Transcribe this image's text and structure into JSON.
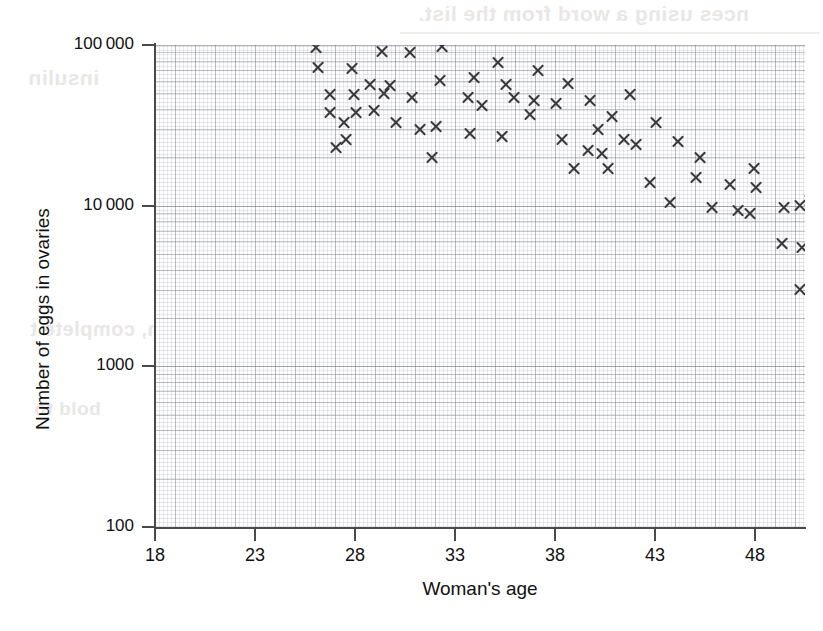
{
  "figure": {
    "kind": "scatter-graph",
    "marker": "cross-x-marker",
    "background_bleed_text": {
      "top": "nces using a word from the list.",
      "insulin": "insulin",
      "middle": "can, complete t",
      "bold": "bold to",
      "right": "the"
    }
  },
  "chart_data": {
    "type": "scatter",
    "title": "",
    "xlabel": "Woman's age",
    "ylabel": "Number of eggs in ovaries",
    "xlim": [
      18,
      50.5
    ],
    "ylim": [
      100,
      120000
    ],
    "yscale": "log",
    "xticks": [
      18,
      23,
      28,
      33,
      38,
      43,
      48
    ],
    "xtick_labels": [
      "18",
      "23",
      "28",
      "33",
      "38",
      "43",
      "48"
    ],
    "yticks": [
      100,
      1000,
      10000,
      100000
    ],
    "ytick_labels": [
      "100",
      "1000",
      "10 000",
      "100 000"
    ],
    "grid": "minor and major grid lines on both axes",
    "legend": "none",
    "marker_style": "x",
    "marker_color": "#3a3a3c",
    "n_points": 74,
    "points": [
      {
        "age": 18.3,
        "eggs": 97000
      },
      {
        "age": 18.4,
        "eggs": 72000
      },
      {
        "age": 19.9,
        "eggs": 108000
      },
      {
        "age": 20.1,
        "eggs": 71000
      },
      {
        "age": 19.0,
        "eggs": 49000
      },
      {
        "age": 20.2,
        "eggs": 49000
      },
      {
        "age": 19.0,
        "eggs": 38000
      },
      {
        "age": 20.3,
        "eggs": 38000
      },
      {
        "age": 19.7,
        "eggs": 33000
      },
      {
        "age": 19.8,
        "eggs": 26000
      },
      {
        "age": 19.3,
        "eggs": 23000
      },
      {
        "age": 21.6,
        "eggs": 91000
      },
      {
        "age": 21.7,
        "eggs": 50000
      },
      {
        "age": 21.2,
        "eggs": 39000
      },
      {
        "age": 22.3,
        "eggs": 33000
      },
      {
        "age": 23.0,
        "eggs": 90000
      },
      {
        "age": 23.1,
        "eggs": 47000
      },
      {
        "age": 23.5,
        "eggs": 30000
      },
      {
        "age": 24.6,
        "eggs": 98000
      },
      {
        "age": 24.5,
        "eggs": 60000
      },
      {
        "age": 24.3,
        "eggs": 31000
      },
      {
        "age": 24.1,
        "eggs": 20000
      },
      {
        "age": 26.2,
        "eggs": 63000
      },
      {
        "age": 26.6,
        "eggs": 42000
      },
      {
        "age": 26.0,
        "eggs": 28000
      },
      {
        "age": 27.4,
        "eggs": 78000
      },
      {
        "age": 27.8,
        "eggs": 57000
      },
      {
        "age": 28.2,
        "eggs": 47000
      },
      {
        "age": 27.6,
        "eggs": 27000
      },
      {
        "age": 29.4,
        "eggs": 69000
      },
      {
        "age": 29.2,
        "eggs": 45000
      },
      {
        "age": 29.0,
        "eggs": 37000
      },
      {
        "age": 30.9,
        "eggs": 58000
      },
      {
        "age": 30.3,
        "eggs": 43000
      },
      {
        "age": 30.6,
        "eggs": 26000
      },
      {
        "age": 31.2,
        "eggs": 17000
      },
      {
        "age": 32.0,
        "eggs": 45000
      },
      {
        "age": 32.4,
        "eggs": 30000
      },
      {
        "age": 31.9,
        "eggs": 22000
      },
      {
        "age": 33.1,
        "eggs": 36000
      },
      {
        "age": 32.6,
        "eggs": 21000
      },
      {
        "age": 32.9,
        "eggs": 17000
      },
      {
        "age": 34.0,
        "eggs": 49000
      },
      {
        "age": 33.7,
        "eggs": 26000
      },
      {
        "age": 34.3,
        "eggs": 24000
      },
      {
        "age": 35.3,
        "eggs": 33000
      },
      {
        "age": 35.0,
        "eggs": 14000
      },
      {
        "age": 36.4,
        "eggs": 25000
      },
      {
        "age": 36.0,
        "eggs": 10500
      },
      {
        "age": 37.5,
        "eggs": 20000
      },
      {
        "age": 37.3,
        "eggs": 15000
      },
      {
        "age": 38.1,
        "eggs": 9700
      },
      {
        "age": 39.0,
        "eggs": 13500
      },
      {
        "age": 39.4,
        "eggs": 9300
      },
      {
        "age": 40.2,
        "eggs": 17000
      },
      {
        "age": 40.3,
        "eggs": 13000
      },
      {
        "age": 40.0,
        "eggs": 9000
      },
      {
        "age": 41.7,
        "eggs": 9800
      },
      {
        "age": 42.5,
        "eggs": 10000
      },
      {
        "age": 41.6,
        "eggs": 5800
      },
      {
        "age": 42.6,
        "eggs": 5500
      },
      {
        "age": 43.0,
        "eggs": 10700
      },
      {
        "age": 43.9,
        "eggs": 5900
      },
      {
        "age": 43.1,
        "eggs": 4100
      },
      {
        "age": 42.5,
        "eggs": 3000
      },
      {
        "age": 44.7,
        "eggs": 3500
      },
      {
        "age": 44.7,
        "eggs": 1450
      },
      {
        "age": 46.7,
        "eggs": 1350
      },
      {
        "age": 46.7,
        "eggs": 930
      },
      {
        "age": 45.7,
        "eggs": 560
      },
      {
        "age": 47.9,
        "eggs": 300
      },
      {
        "age": 25.9,
        "eggs": 47000
      },
      {
        "age": 22.0,
        "eggs": 56000
      },
      {
        "age": 21.0,
        "eggs": 57000
      }
    ]
  }
}
